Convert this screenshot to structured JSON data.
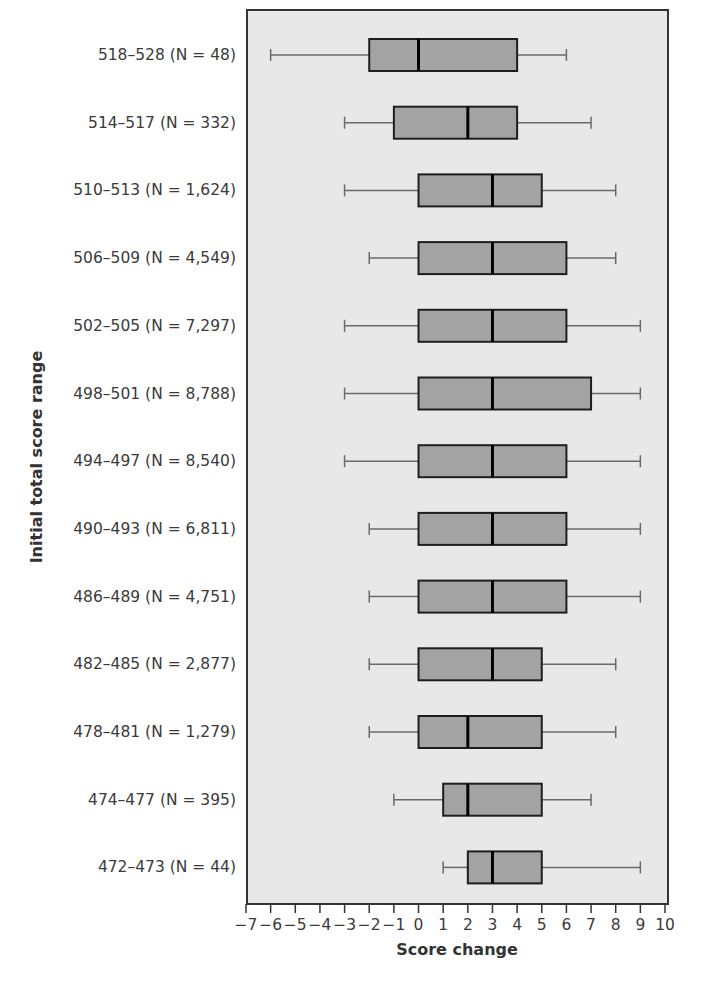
{
  "chart_data": {
    "type": "boxplot",
    "orientation": "horizontal",
    "title": "",
    "xlabel": "Score change",
    "ylabel": "Initial total score range",
    "xlim": [
      -7,
      10
    ],
    "xticks": [
      -7,
      -6,
      -5,
      -4,
      -3,
      -2,
      -1,
      0,
      1,
      2,
      3,
      4,
      5,
      6,
      7,
      8,
      9,
      10
    ],
    "grid": false,
    "legend": null,
    "colors": {
      "plot_bg": "#e8e8e8",
      "box_fill": "#a3a3a3",
      "box_stroke": "#1e1e1e",
      "whisker": "#6a6a6a",
      "median": "#000000"
    },
    "categories": [
      {
        "label": "518–528 (N = 48)",
        "range": "518–528",
        "n": 48,
        "whisker_low": -6,
        "q1": -2,
        "median": 0,
        "q3": 4,
        "whisker_high": 6
      },
      {
        "label": "514–517 (N = 332)",
        "range": "514–517",
        "n": 332,
        "whisker_low": -3,
        "q1": -1,
        "median": 2,
        "q3": 4,
        "whisker_high": 7
      },
      {
        "label": "510–513 (N = 1,624)",
        "range": "510–513",
        "n": 1624,
        "whisker_low": -3,
        "q1": 0,
        "median": 3,
        "q3": 5,
        "whisker_high": 8
      },
      {
        "label": "506–509 (N = 4,549)",
        "range": "506–509",
        "n": 4549,
        "whisker_low": -2,
        "q1": 0,
        "median": 3,
        "q3": 6,
        "whisker_high": 8
      },
      {
        "label": "502–505 (N = 7,297)",
        "range": "502–505",
        "n": 7297,
        "whisker_low": -3,
        "q1": 0,
        "median": 3,
        "q3": 6,
        "whisker_high": 9
      },
      {
        "label": "498–501 (N = 8,788)",
        "range": "498–501",
        "n": 8788,
        "whisker_low": -3,
        "q1": 0,
        "median": 3,
        "q3": 7,
        "whisker_high": 9
      },
      {
        "label": "494–497 (N = 8,540)",
        "range": "494–497",
        "n": 8540,
        "whisker_low": -3,
        "q1": 0,
        "median": 3,
        "q3": 6,
        "whisker_high": 9
      },
      {
        "label": "490–493 (N = 6,811)",
        "range": "490–493",
        "n": 6811,
        "whisker_low": -2,
        "q1": 0,
        "median": 3,
        "q3": 6,
        "whisker_high": 9
      },
      {
        "label": "486–489 (N = 4,751)",
        "range": "486–489",
        "n": 4751,
        "whisker_low": -2,
        "q1": 0,
        "median": 3,
        "q3": 6,
        "whisker_high": 9
      },
      {
        "label": "482–485 (N = 2,877)",
        "range": "482–485",
        "n": 2877,
        "whisker_low": -2,
        "q1": 0,
        "median": 3,
        "q3": 5,
        "whisker_high": 8
      },
      {
        "label": "478–481 (N = 1,279)",
        "range": "478–481",
        "n": 1279,
        "whisker_low": -2,
        "q1": 0,
        "median": 2,
        "q3": 5,
        "whisker_high": 8
      },
      {
        "label": "474–477 (N = 395)",
        "range": "474–477",
        "n": 395,
        "whisker_low": -1,
        "q1": 1,
        "median": 2,
        "q3": 5,
        "whisker_high": 7
      },
      {
        "label": "472–473 (N = 44)",
        "range": "472–473",
        "n": 44,
        "whisker_low": 1,
        "q1": 2,
        "median": 3,
        "q3": 5,
        "whisker_high": 9
      }
    ]
  }
}
